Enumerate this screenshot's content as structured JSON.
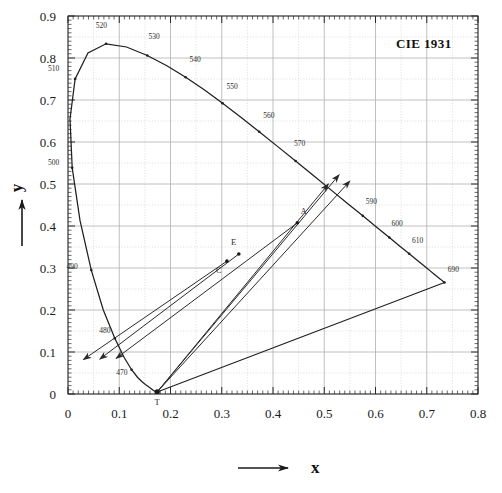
{
  "figure": {
    "title": "CIE 1931",
    "caption": "",
    "bg_color": "#ffffff",
    "ink_color": "#1a1a1a",
    "grid_color": "#b9b9b9"
  },
  "axes": {
    "x": {
      "label": "x",
      "arrow": "right-arrow-icon",
      "min": 0,
      "max": 0.8,
      "ticks": [
        0,
        0.1,
        0.2,
        0.3,
        0.4,
        0.5,
        0.6,
        0.7,
        0.8
      ],
      "tick_labels": [
        "0",
        "0.1",
        "0.2",
        "0.3",
        "0.4",
        "0.5",
        "0.6",
        "0.7",
        "0.8"
      ],
      "minor_per_major": 10
    },
    "y": {
      "label": "y",
      "arrow": "up-arrow-icon",
      "min": 0,
      "max": 0.9,
      "ticks": [
        0,
        0.1,
        0.2,
        0.3,
        0.4,
        0.5,
        0.6,
        0.7,
        0.8,
        0.9
      ],
      "tick_labels": [
        "0",
        "0.1",
        "0.2",
        "0.3",
        "0.4",
        "0.5",
        "0.6",
        "0.7",
        "0.8",
        "0.9"
      ],
      "minor_per_major": 10
    }
  },
  "chart_data": {
    "type": "line",
    "title": "CIE 1931",
    "xlabel": "x",
    "ylabel": "y",
    "xlim": [
      0,
      0.8
    ],
    "ylim": [
      0,
      0.9
    ],
    "grid": true,
    "legend": "none",
    "series": [
      {
        "name": "spectral-locus",
        "kind": "curve",
        "points": [
          [
            0.1741,
            0.005
          ],
          [
            0.174,
            0.005
          ],
          [
            0.1738,
            0.0049
          ],
          [
            0.1736,
            0.0049
          ],
          [
            0.1733,
            0.0048
          ],
          [
            0.173,
            0.0048
          ],
          [
            0.1726,
            0.0048
          ],
          [
            0.1721,
            0.0048
          ],
          [
            0.1714,
            0.0051
          ],
          [
            0.1703,
            0.0058
          ],
          [
            0.1689,
            0.0069
          ],
          [
            0.1669,
            0.0086
          ],
          [
            0.1644,
            0.0109
          ],
          [
            0.1611,
            0.0138
          ],
          [
            0.1566,
            0.0177
          ],
          [
            0.151,
            0.0227
          ],
          [
            0.144,
            0.0297
          ],
          [
            0.1355,
            0.0399
          ],
          [
            0.1241,
            0.0578
          ],
          [
            0.1096,
            0.0868
          ],
          [
            0.0913,
            0.1327
          ],
          [
            0.0687,
            0.2007
          ],
          [
            0.0454,
            0.295
          ],
          [
            0.0235,
            0.4127
          ],
          [
            0.0082,
            0.5384
          ],
          [
            0.0039,
            0.6548
          ],
          [
            0.0139,
            0.7502
          ],
          [
            0.0389,
            0.812
          ],
          [
            0.0743,
            0.8338
          ],
          [
            0.1142,
            0.8262
          ],
          [
            0.1547,
            0.8059
          ],
          [
            0.1929,
            0.7816
          ],
          [
            0.2296,
            0.7543
          ],
          [
            0.2658,
            0.7243
          ],
          [
            0.3016,
            0.6923
          ],
          [
            0.3373,
            0.6589
          ],
          [
            0.3731,
            0.6245
          ],
          [
            0.4087,
            0.5896
          ],
          [
            0.4441,
            0.5547
          ],
          [
            0.4788,
            0.5202
          ],
          [
            0.5125,
            0.4866
          ],
          [
            0.5448,
            0.4544
          ],
          [
            0.5752,
            0.4242
          ],
          [
            0.6029,
            0.3965
          ],
          [
            0.627,
            0.3725
          ],
          [
            0.6482,
            0.3514
          ],
          [
            0.6658,
            0.334
          ],
          [
            0.6801,
            0.3197
          ],
          [
            0.6915,
            0.3083
          ],
          [
            0.7006,
            0.2993
          ],
          [
            0.7079,
            0.292
          ],
          [
            0.714,
            0.2859
          ],
          [
            0.719,
            0.2809
          ],
          [
            0.723,
            0.277
          ],
          [
            0.726,
            0.274
          ],
          [
            0.7283,
            0.2717
          ],
          [
            0.73,
            0.27
          ],
          [
            0.7311,
            0.2689
          ],
          [
            0.732,
            0.268
          ],
          [
            0.7327,
            0.2673
          ],
          [
            0.7334,
            0.2666
          ],
          [
            0.734,
            0.266
          ],
          [
            0.7344,
            0.2656
          ],
          [
            0.7346,
            0.2654
          ],
          [
            0.7347,
            0.2653
          ]
        ]
      },
      {
        "name": "purple-line",
        "kind": "line",
        "points": [
          [
            0.7347,
            0.2653
          ],
          [
            0.1741,
            0.005
          ]
        ]
      }
    ],
    "wavelength_ticks": [
      {
        "label": "470",
        "x": 0.1241,
        "y": 0.0578,
        "lx": 0.105,
        "ly": 0.046
      },
      {
        "label": "480",
        "x": 0.0913,
        "y": 0.1327,
        "lx": 0.072,
        "ly": 0.145
      },
      {
        "label": "490",
        "x": 0.0454,
        "y": 0.295,
        "lx": 0.008,
        "ly": 0.297
      },
      {
        "label": "500",
        "x": 0.0082,
        "y": 0.5384,
        "lx": -0.028,
        "ly": 0.545
      },
      {
        "label": "510",
        "x": 0.0139,
        "y": 0.7502,
        "lx": -0.028,
        "ly": 0.77
      },
      {
        "label": "520",
        "x": 0.0743,
        "y": 0.8338,
        "lx": 0.065,
        "ly": 0.872
      },
      {
        "label": "530",
        "x": 0.1547,
        "y": 0.8059,
        "lx": 0.168,
        "ly": 0.845
      },
      {
        "label": "540",
        "x": 0.2296,
        "y": 0.7543,
        "lx": 0.248,
        "ly": 0.79
      },
      {
        "label": "550",
        "x": 0.3016,
        "y": 0.6923,
        "lx": 0.32,
        "ly": 0.727
      },
      {
        "label": "560",
        "x": 0.3731,
        "y": 0.6245,
        "lx": 0.392,
        "ly": 0.657
      },
      {
        "label": "570",
        "x": 0.4441,
        "y": 0.5547,
        "lx": 0.452,
        "ly": 0.59
      },
      {
        "label": "590",
        "x": 0.5752,
        "y": 0.4242,
        "lx": 0.592,
        "ly": 0.452
      },
      {
        "label": "600",
        "x": 0.627,
        "y": 0.3725,
        "lx": 0.642,
        "ly": 0.4
      },
      {
        "label": "610",
        "x": 0.6658,
        "y": 0.334,
        "lx": 0.682,
        "ly": 0.36
      },
      {
        "label": "690",
        "x": 0.7347,
        "y": 0.2653,
        "lx": 0.752,
        "ly": 0.29
      }
    ],
    "marked_points": [
      {
        "name": "T",
        "label": "T",
        "x": 0.1741,
        "y": 0.005,
        "label_dx": 0.0,
        "label_dy": -0.03
      },
      {
        "name": "C",
        "label": "C",
        "x": 0.3101,
        "y": 0.3163,
        "label_dx": -0.016,
        "label_dy": -0.028
      },
      {
        "name": "E",
        "label": "E",
        "x": 0.3333,
        "y": 0.3333,
        "label_dx": -0.01,
        "label_dy": 0.022
      },
      {
        "name": "A",
        "label": "A",
        "x": 0.4476,
        "y": 0.4075,
        "label_dx": 0.012,
        "label_dy": 0.02
      }
    ],
    "dominant_wavelength_lines": [
      {
        "name": "line-T-C",
        "from": [
          0.1741,
          0.005
        ],
        "through": [
          0.3101,
          0.3163
        ],
        "to": [
          0.508,
          0.5
        ]
      },
      {
        "name": "line-T-E",
        "from": [
          0.1741,
          0.005
        ],
        "through": [
          0.3333,
          0.3333
        ],
        "to": [
          0.529,
          0.522
        ]
      },
      {
        "name": "line-T-A",
        "from": [
          0.1741,
          0.005
        ],
        "through": [
          0.4476,
          0.4075
        ],
        "to": [
          0.55,
          0.507
        ]
      }
    ],
    "complementary_arrows": [
      {
        "name": "arrow-C",
        "from": [
          0.3101,
          0.3163
        ],
        "to": [
          0.03,
          0.082
        ]
      },
      {
        "name": "arrow-E",
        "from": [
          0.3333,
          0.3333
        ],
        "to": [
          0.062,
          0.083
        ]
      },
      {
        "name": "arrow-A",
        "from": [
          0.4476,
          0.4075
        ],
        "to": [
          0.094,
          0.085
        ]
      }
    ]
  }
}
